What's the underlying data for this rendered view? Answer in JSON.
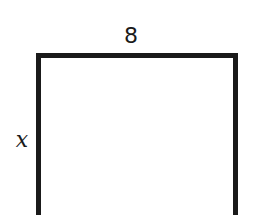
{
  "diagram": {
    "shape": "rectangle",
    "labels": {
      "top": "8",
      "left": "x"
    },
    "stroke_color": "#1a1a1a",
    "fill_color": "#ffffff"
  }
}
